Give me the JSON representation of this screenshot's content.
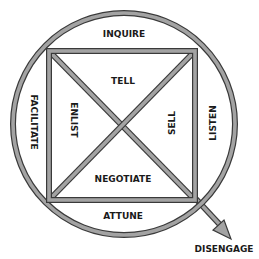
{
  "diagram": {
    "title": "",
    "colors": {
      "stroke_fill": "#a3a3a3",
      "stroke_outline": "#3a3a3a",
      "text": "#1a1a1a",
      "background": "#ffffff"
    },
    "outer_ring": {
      "shape": "circle",
      "labels": {
        "top": "INQUIRE",
        "left": "FACILITATE",
        "right": "LISTEN",
        "bottom": "ATTUNE"
      }
    },
    "inner_square": {
      "shape": "square-with-diagonals",
      "labels": {
        "top": "TELL",
        "left": "ENLIST",
        "right": "SELL",
        "bottom": "NEGOTIATE"
      }
    },
    "exit_arrow": {
      "direction": "down-right",
      "label": "DISENGAGE"
    }
  }
}
